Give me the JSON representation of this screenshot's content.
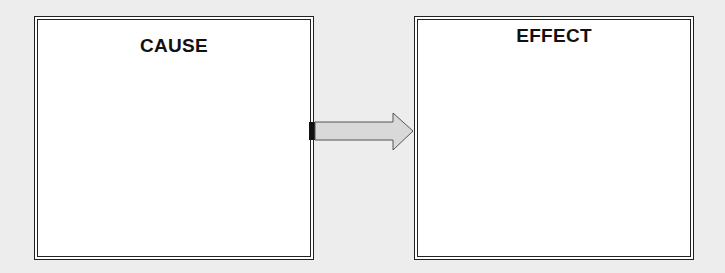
{
  "diagram": {
    "left_box": {
      "title": "CAUSE"
    },
    "right_box": {
      "title": "EFFECT"
    },
    "connector": {
      "direction": "left-to-right",
      "fill": "#d9d9d9",
      "stroke": "#555555"
    }
  }
}
